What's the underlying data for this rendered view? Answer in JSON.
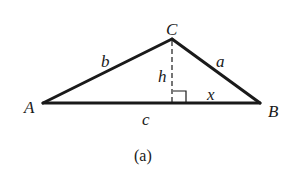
{
  "diagram": {
    "caption": "(a)",
    "vertices": {
      "A": {
        "label": "A",
        "x": 43,
        "y": 103
      },
      "B": {
        "label": "B",
        "x": 260,
        "y": 103
      },
      "C": {
        "label": "C",
        "x": 172,
        "y": 39
      }
    },
    "sides": {
      "a": {
        "label": "a",
        "between": [
          "B",
          "C"
        ]
      },
      "b": {
        "label": "b",
        "between": [
          "A",
          "C"
        ]
      },
      "c": {
        "label": "c",
        "between": [
          "A",
          "B"
        ]
      }
    },
    "altitude": {
      "label": "h",
      "from": "C",
      "foot_x": 172,
      "style": "dashed"
    },
    "segment_x": {
      "label": "x",
      "description": "distance from foot of altitude to B"
    },
    "right_angle_marker": true,
    "colors": {
      "stroke": "#1a1a1a",
      "background": "#ffffff"
    }
  }
}
